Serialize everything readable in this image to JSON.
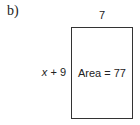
{
  "part_label": "b)",
  "figure": {
    "shape": "rectangle",
    "width_label": "7",
    "height_label": {
      "variable": "x",
      "rest": " + 9"
    },
    "area_label": "Area = 77"
  }
}
